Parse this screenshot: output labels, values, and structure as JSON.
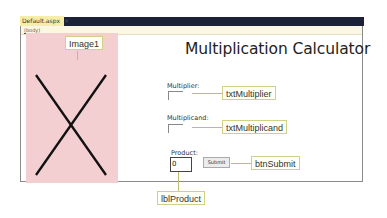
{
  "editor": {
    "tab": {
      "label": "Default.aspx",
      "close_glyph": "×"
    },
    "breadcrumb": "(body)"
  },
  "page": {
    "title": "Multiplication Calculator",
    "multiplier_label": "Multiplier:",
    "multiplicand_label": "Multiplicand:",
    "product_label": "Product:",
    "product_value": "0",
    "submit_label": "Submit"
  },
  "callouts": {
    "image": "Image1",
    "multiplier": "txtMultiplier",
    "multiplicand": "txtMultiplicand",
    "submit": "btnSubmit",
    "product": "lblProduct"
  },
  "colors": {
    "tabbar": "#1b2238",
    "tab": "#f6eea8",
    "image_placeholder": "#f3cfd2",
    "callout_border": "#cfd08a"
  }
}
